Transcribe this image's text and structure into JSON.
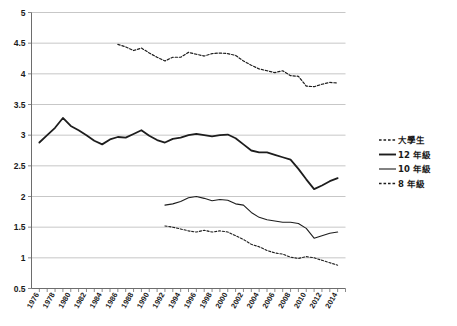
{
  "chart_data": {
    "type": "line",
    "title": "",
    "subtitle": "",
    "xlabel": "",
    "ylabel": "",
    "xlim": [
      1975,
      2015
    ],
    "ylim": [
      0.5,
      5
    ],
    "ytick_values": [
      0.5,
      1,
      1.5,
      2,
      2.5,
      3,
      3.5,
      4,
      4.5,
      5
    ],
    "ytick_labels": [
      "0.5",
      "1",
      "1.5",
      "2",
      "2.5",
      "3",
      "3.5",
      "4",
      "4.5",
      "5"
    ],
    "grid": true,
    "legend_position": "right-middle",
    "xtick_labels": [
      "1976",
      "1978",
      "1980",
      "1982",
      "1984",
      "1986",
      "1988",
      "1990",
      "1992",
      "1994",
      "1996",
      "1998",
      "2000",
      "2002",
      "2004",
      "2006",
      "2008",
      "2010",
      "2012",
      "2014"
    ],
    "xtick_values": [
      1976,
      1978,
      1980,
      1982,
      1984,
      1986,
      1988,
      1990,
      1992,
      1994,
      1996,
      1998,
      2000,
      2002,
      2004,
      2006,
      2008,
      2010,
      2012,
      2014
    ],
    "series": [
      {
        "name": "大學生",
        "style": "dashed",
        "width": 1.2,
        "color": "#1d1d1d",
        "x": [
          1986,
          1987,
          1988,
          1989,
          1990,
          1991,
          1992,
          1993,
          1994,
          1995,
          1996,
          1997,
          1998,
          1999,
          2000,
          2001,
          2002,
          2003,
          2004,
          2005,
          2006,
          2007,
          2008,
          2009,
          2010,
          2011,
          2012,
          2013,
          2014
        ],
        "values": [
          4.48,
          4.44,
          4.38,
          4.42,
          4.34,
          4.27,
          4.21,
          4.27,
          4.27,
          4.35,
          4.32,
          4.29,
          4.33,
          4.34,
          4.33,
          4.3,
          4.21,
          4.14,
          4.08,
          4.05,
          4.02,
          4.05,
          3.97,
          3.96,
          3.8,
          3.79,
          3.83,
          3.86,
          3.85
        ]
      },
      {
        "name": "12 年級",
        "style": "solid",
        "width": 1.8,
        "color": "#1d1d1d",
        "x": [
          1976,
          1977,
          1978,
          1979,
          1980,
          1981,
          1982,
          1983,
          1984,
          1985,
          1986,
          1987,
          1988,
          1989,
          1990,
          1991,
          1992,
          1993,
          1994,
          1995,
          1996,
          1997,
          1998,
          1999,
          2000,
          2001,
          2002,
          2003,
          2004,
          2005,
          2006,
          2007,
          2008,
          2009,
          2010,
          2011,
          2012,
          2013,
          2014
        ],
        "values": [
          2.88,
          3.0,
          3.12,
          3.28,
          3.15,
          3.08,
          3.0,
          2.91,
          2.85,
          2.93,
          2.97,
          2.96,
          3.02,
          3.08,
          2.99,
          2.92,
          2.88,
          2.94,
          2.96,
          3.0,
          3.02,
          3.0,
          2.98,
          3.0,
          3.01,
          2.95,
          2.85,
          2.75,
          2.72,
          2.72,
          2.68,
          2.64,
          2.6,
          2.45,
          2.28,
          2.12,
          2.18,
          2.25,
          2.3
        ]
      },
      {
        "name": "10 年級",
        "style": "solid",
        "width": 1.1,
        "color": "#4a4a4a",
        "x": [
          1992,
          1993,
          1994,
          1995,
          1996,
          1997,
          1998,
          1999,
          2000,
          2001,
          2002,
          2003,
          2004,
          2005,
          2006,
          2007,
          2008,
          2009,
          2010,
          2011,
          2012,
          2013,
          2014
        ],
        "values": [
          1.86,
          1.88,
          1.92,
          1.98,
          2.0,
          1.97,
          1.93,
          1.95,
          1.94,
          1.88,
          1.86,
          1.74,
          1.66,
          1.62,
          1.6,
          1.58,
          1.58,
          1.56,
          1.48,
          1.32,
          1.36,
          1.4,
          1.42
        ]
      },
      {
        "name": "8 年級",
        "style": "dashed",
        "width": 1.1,
        "color": "#1d1d1d",
        "x": [
          1992,
          1993,
          1994,
          1995,
          1996,
          1997,
          1998,
          1999,
          2000,
          2001,
          2002,
          2003,
          2004,
          2005,
          2006,
          2007,
          2008,
          2009,
          2010,
          2011,
          2012,
          2013,
          2014
        ],
        "values": [
          1.52,
          1.5,
          1.47,
          1.44,
          1.42,
          1.45,
          1.42,
          1.44,
          1.42,
          1.36,
          1.3,
          1.22,
          1.18,
          1.12,
          1.08,
          1.06,
          1.01,
          0.99,
          1.02,
          1.0,
          0.96,
          0.92,
          0.88
        ]
      }
    ],
    "legend_entries": [
      {
        "label": "大學生",
        "style": "dashed"
      },
      {
        "label": "12 年級",
        "style": "solid-thick"
      },
      {
        "label": "10 年級",
        "style": "solid-thin"
      },
      {
        "label": "8 年級",
        "style": "dashed"
      }
    ]
  }
}
